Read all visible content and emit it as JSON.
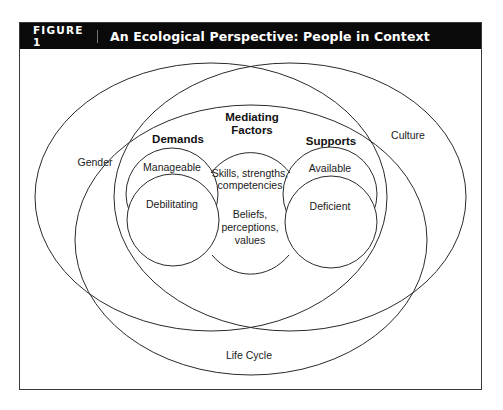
{
  "figure": {
    "number_label": "FIGURE 1",
    "title": "An Ecological Perspective: People in Context"
  },
  "colors": {
    "header_bg": "#0a0a0a",
    "header_text": "#ffffff",
    "line": "#2a2a2a",
    "background": "#ffffff"
  },
  "diagram": {
    "outer_ellipses": [
      {
        "id": "gender",
        "label": "Gender"
      },
      {
        "id": "culture",
        "label": "Culture"
      },
      {
        "id": "life-cycle",
        "label": "Life Cycle"
      }
    ],
    "demands": {
      "heading": "Demands",
      "items": [
        "Manageable",
        "Debilitating"
      ]
    },
    "mediating_factors": {
      "heading_line1": "Mediating",
      "heading_line2": "Factors",
      "group1": [
        "Skills, strengths,",
        "competencies"
      ],
      "group2": [
        "Beliefs,",
        "perceptions,",
        "values"
      ]
    },
    "supports": {
      "heading": "Supports",
      "items": [
        "Available",
        "Deficient"
      ]
    }
  }
}
